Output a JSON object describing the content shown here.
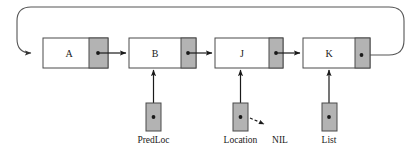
{
  "diagram": {
    "type": "linked-list",
    "colors": {
      "node_fill": "#ffffff",
      "pointer_fill": "#b3b3b3",
      "stroke": "#4a4a4a",
      "line": "#1a1a1a",
      "background": "#ffffff"
    },
    "nodes": [
      {
        "id": "node-a",
        "label": "A",
        "x": 43,
        "y": 38,
        "width": 65,
        "height": 30,
        "ptr_width": 19
      },
      {
        "id": "node-b",
        "label": "B",
        "x": 129,
        "y": 38,
        "width": 67,
        "height": 30,
        "ptr_width": 15
      },
      {
        "id": "node-j",
        "label": "J",
        "x": 215,
        "y": 38,
        "width": 68,
        "height": 30,
        "ptr_width": 14
      },
      {
        "id": "node-k",
        "label": "K",
        "x": 303,
        "y": 38,
        "width": 67,
        "height": 30,
        "ptr_width": 15
      }
    ],
    "variables": [
      {
        "id": "var-predloc",
        "label": "PredLoc",
        "x": 146,
        "y": 103,
        "width": 15,
        "height": 28,
        "target": "node-b"
      },
      {
        "id": "var-location",
        "label": "Location",
        "x": 233,
        "y": 103,
        "width": 15,
        "height": 28,
        "target": "node-j"
      },
      {
        "id": "var-list",
        "label": "List",
        "x": 322,
        "y": 103,
        "width": 15,
        "height": 28,
        "target": "node-k"
      }
    ],
    "annotations": [
      {
        "id": "nil-annotation",
        "label": "NIL",
        "x": 280,
        "y": 142
      }
    ],
    "links": [
      {
        "from": "node-a",
        "to": "node-b",
        "kind": "solid-arrow"
      },
      {
        "from": "node-b",
        "to": "node-j",
        "kind": "solid-arrow"
      },
      {
        "from": "node-j",
        "to": "node-k",
        "kind": "solid-arrow"
      },
      {
        "from": "node-k",
        "to": "node-a",
        "kind": "wrap-around"
      },
      {
        "from": "var-location",
        "to": "nil-annotation",
        "kind": "dashed-arrow"
      }
    ]
  }
}
